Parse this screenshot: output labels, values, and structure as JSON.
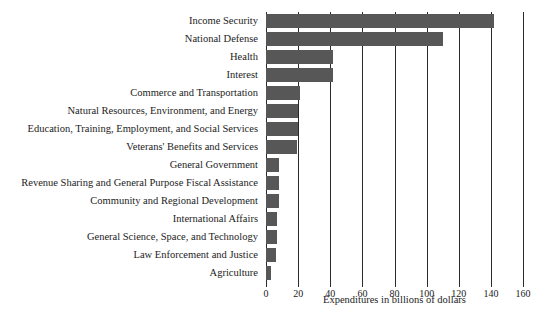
{
  "top_fragment": "",
  "chart_data": {
    "type": "bar",
    "orientation": "horizontal",
    "title": "",
    "xlabel": "Expenditures in billions of dollars",
    "ylabel": "",
    "xlim": [
      0,
      160
    ],
    "xticks": [
      0,
      20,
      40,
      60,
      80,
      100,
      120,
      140,
      160
    ],
    "grid": "vertical",
    "legend": "none",
    "bar_color": "#575757",
    "axis_color": "#2b2b2b",
    "categories": [
      "Income Security",
      "National Defense",
      "Health",
      "Interest",
      "Commerce and Transportation",
      "Natural Resources, Environment, and Energy",
      "Education, Training, Employment, and Social Services",
      "Veterans' Benefits and Services",
      "General Government",
      "Revenue Sharing and General Purpose Fiscal Assistance",
      "Community and Regional Development",
      "International Affairs",
      "General Science, Space, and Technology",
      "Law Enforcement and Justice",
      "Agriculture"
    ],
    "values": [
      142,
      110,
      42,
      42,
      21,
      20,
      20,
      19,
      8,
      8,
      8,
      7,
      7,
      6,
      3
    ]
  }
}
